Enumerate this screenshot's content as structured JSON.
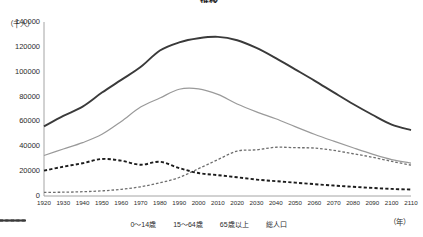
{
  "chart_title": "推移",
  "axes": {
    "y_unit_label": "（千人）",
    "x_unit_label": "（年）",
    "y_ticks": [
      "140000",
      "120000",
      "100000",
      "80000",
      "60000",
      "40000",
      "20000",
      "0"
    ],
    "y_min": 0,
    "y_max": 140000,
    "x_ticks": [
      "1920",
      "1930",
      "1940",
      "1950",
      "1960",
      "1970",
      "1980",
      "1990",
      "2000",
      "2010",
      "2020",
      "2030",
      "2040",
      "2050",
      "2060",
      "2070",
      "2080",
      "2090",
      "2100",
      "2110"
    ],
    "x_min": 1920,
    "x_max": 2110,
    "grid": false
  },
  "legend": {
    "position": "bottom",
    "items": [
      {
        "label": "0～14歳",
        "style": "thick-dashed",
        "color": "#1c1c1c"
      },
      {
        "label": "15～64歳",
        "style": "solid-thin",
        "color": "#9a9a9a"
      },
      {
        "label": "65歳以上",
        "style": "fine-dashed",
        "color": "#6e6e6e"
      },
      {
        "label": "総人口",
        "style": "thick-solid",
        "color": "#3a3a3a"
      }
    ]
  },
  "chart_data": {
    "type": "line",
    "title": "推移",
    "xlabel": "（年）",
    "ylabel": "（千人）",
    "xlim": [
      1920,
      2110
    ],
    "ylim": [
      0,
      140000
    ],
    "grid": false,
    "x": [
      1920,
      1930,
      1940,
      1950,
      1960,
      1970,
      1980,
      1990,
      2000,
      2010,
      2020,
      2030,
      2040,
      2050,
      2060,
      2070,
      2080,
      2090,
      2100,
      2110
    ],
    "series": [
      {
        "name": "総人口",
        "color": "#3a3a3a",
        "style": "thick-solid",
        "values": [
          55963,
          64450,
          71933,
          83200,
          93419,
          103720,
          117060,
          123611,
          126926,
          128057,
          125325,
          119125,
          110919,
          101923,
          92840,
          83360,
          74030,
          65400,
          57500,
          53000
        ]
      },
      {
        "name": "15～64歳",
        "color": "#9a9a9a",
        "style": "solid-thin",
        "values": [
          32605,
          37807,
          42960,
          49661,
          60002,
          71566,
          78835,
          85904,
          86220,
          81735,
          74058,
          67730,
          62133,
          55845,
          49730,
          44150,
          38800,
          33700,
          29300,
          26500
        ]
      },
      {
        "name": "0～14歳",
        "color": "#1c1c1c",
        "style": "thick-dashed",
        "values": [
          20416,
          23579,
          26369,
          29786,
          28434,
          25153,
          27507,
          22486,
          18472,
          16803,
          15075,
          13212,
          11936,
          10767,
          9508,
          8400,
          7400,
          6500,
          5700,
          5200
        ]
      },
      {
        "name": "65歳以上",
        "color": "#6e6e6e",
        "style": "fine-dashed",
        "values": [
          2941,
          3064,
          3454,
          4109,
          5398,
          7393,
          10647,
          14895,
          22005,
          29246,
          36192,
          37160,
          39206,
          38878,
          38564,
          36720,
          34000,
          31200,
          27900,
          24800
        ]
      }
    ]
  }
}
